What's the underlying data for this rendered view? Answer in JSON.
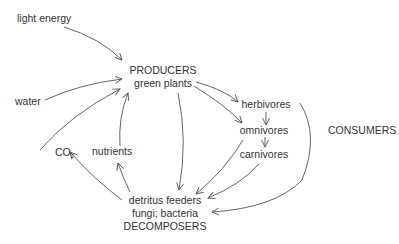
{
  "diagram": {
    "type": "food-web / energy flow",
    "nodes": {
      "light_energy": "light energy",
      "producers_title": "PRODUCERS",
      "producers_sub": "green plants",
      "water": "water",
      "co2_base": "CO",
      "co2_sub": "2",
      "nutrients": "nutrients",
      "herbivores": "herbivores",
      "omnivores": "omnivores",
      "carnivores": "carnivores",
      "consumers": "CONSUMERS",
      "decomposers_line1": "detritus feeders",
      "decomposers_line2": "fungi; bacteria",
      "decomposers_title": "DECOMPOSERS"
    },
    "edges": [
      {
        "from": "light energy",
        "to": "PRODUCERS"
      },
      {
        "from": "water",
        "to": "PRODUCERS"
      },
      {
        "from": "CO2",
        "to": "PRODUCERS"
      },
      {
        "from": "nutrients",
        "to": "PRODUCERS"
      },
      {
        "from": "PRODUCERS",
        "to": "herbivores"
      },
      {
        "from": "PRODUCERS",
        "to": "omnivores"
      },
      {
        "from": "PRODUCERS",
        "to": "DECOMPOSERS"
      },
      {
        "from": "herbivores",
        "to": "omnivores"
      },
      {
        "from": "omnivores",
        "to": "carnivores"
      },
      {
        "from": "herbivores",
        "to": "DECOMPOSERS"
      },
      {
        "from": "omnivores",
        "to": "DECOMPOSERS"
      },
      {
        "from": "carnivores",
        "to": "DECOMPOSERS"
      },
      {
        "from": "DECOMPOSERS",
        "to": "CO2"
      },
      {
        "from": "DECOMPOSERS",
        "to": "nutrients"
      }
    ],
    "line_color": "#555555",
    "text_color": "#333333"
  }
}
